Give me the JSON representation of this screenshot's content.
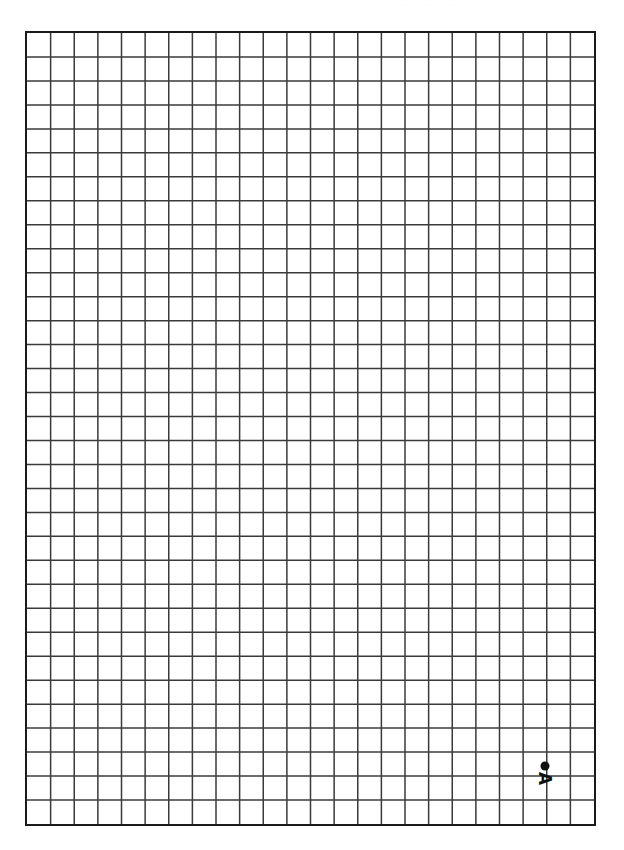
{
  "page": {
    "background_color": "#ffffff",
    "width": 624,
    "height": 850
  },
  "scan_artifact": {
    "text": "· ·· · ··· · ·· ·",
    "color": "#f2f2f3"
  },
  "grid": {
    "columns": 24,
    "rows": 33,
    "cell_width": 23.79,
    "cell_height": 24.09,
    "line_color": "#3a3a3a",
    "line_width": 1.5,
    "border_color": "#1b1b1b",
    "border_width": 2,
    "left": 25,
    "top": 31,
    "width": 571,
    "height": 795,
    "fill_color": "#ffffff"
  },
  "points": [
    {
      "label": "A",
      "label_rotation_deg": 90,
      "marker": "filled-circle",
      "marker_color": "#111111",
      "marker_radius": 4.5,
      "x_px": 545,
      "y_px": 766,
      "grid_col": 22,
      "grid_row_from_top": 30.5,
      "grid_row_from_bottom": 2.5
    }
  ]
}
